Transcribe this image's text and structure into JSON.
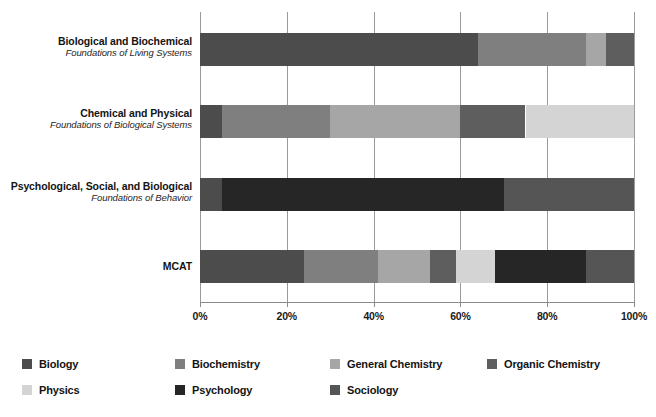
{
  "chart_data": {
    "type": "bar",
    "orientation": "horizontal",
    "stacked": true,
    "normalized": true,
    "title": "",
    "subtitle": "",
    "xlabel": "",
    "ylabel": "",
    "xlim": [
      0,
      100
    ],
    "xticks": [
      0,
      20,
      40,
      60,
      80,
      100
    ],
    "xtick_labels": [
      "0%",
      "20%",
      "40%",
      "60%",
      "80%",
      "100%"
    ],
    "grid": true,
    "grid_axis": "x",
    "legend_position": "bottom",
    "categories": [
      "Biological and Biochemical Foundations of Living Systems",
      "Chemical and Physical Foundations of Biological Systems",
      "Psychological, Social, and Biological Foundations of Behavior",
      "MCAT"
    ],
    "category_labels": [
      {
        "main": "Biological and Biochemical",
        "sub": "Foundations of Living Systems"
      },
      {
        "main": "Chemical and Physical",
        "sub": "Foundations of Biological Systems"
      },
      {
        "main": "Psychological, Social, and Biological",
        "sub": "Foundations of Behavior"
      },
      {
        "main": "MCAT",
        "sub": ""
      }
    ],
    "series": [
      {
        "name": "Biology",
        "color": "#4c4c4c",
        "values": [
          64,
          5,
          5,
          24
        ]
      },
      {
        "name": "Biochemistry",
        "color": "#7f7f7f",
        "values": [
          25,
          25,
          0,
          17
        ]
      },
      {
        "name": "General Chemistry",
        "color": "#a6a6a6",
        "values": [
          4.5,
          30,
          0,
          12
        ]
      },
      {
        "name": "Organic Chemistry",
        "color": "#5e5e5e",
        "values": [
          6.5,
          15,
          0,
          6
        ]
      },
      {
        "name": "Physics",
        "color": "#d4d4d4",
        "values": [
          0,
          25,
          0,
          9
        ]
      },
      {
        "name": "Psychology",
        "color": "#262626",
        "values": [
          0,
          0,
          65,
          21
        ]
      },
      {
        "name": "Sociology",
        "color": "#555555",
        "values": [
          0,
          0,
          30,
          11
        ]
      }
    ]
  },
  "legend": {
    "items": [
      {
        "label": "Biology",
        "color": "#4c4c4c"
      },
      {
        "label": "Biochemistry",
        "color": "#7f7f7f"
      },
      {
        "label": "General Chemistry",
        "color": "#a6a6a6"
      },
      {
        "label": "Organic Chemistry",
        "color": "#5e5e5e"
      },
      {
        "label": "Physics",
        "color": "#d4d4d4"
      },
      {
        "label": "Psychology",
        "color": "#262626"
      },
      {
        "label": "Sociology",
        "color": "#555555"
      }
    ]
  }
}
